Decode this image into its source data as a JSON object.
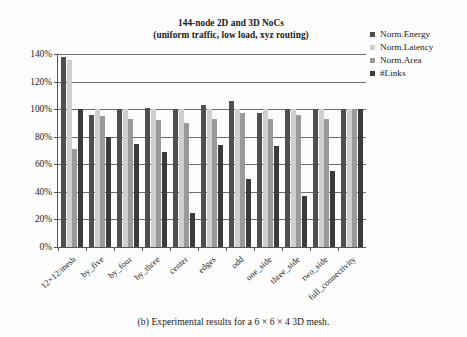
{
  "figure": {
    "caption": "(b) Experimental results for a 6 × 6 × 4 3D mesh."
  },
  "chart_data": {
    "type": "bar",
    "title": "144-node 2D and 3D NoCs\n(uniform traffic, low load, xyz routing)",
    "title_line1": "144-node 2D and 3D NoCs",
    "title_line2": "(uniform traffic, low load, xyz routing)",
    "xlabel": "",
    "ylabel": "",
    "ylim": [
      0,
      140
    ],
    "yticks": [
      0,
      20,
      40,
      60,
      80,
      100,
      120,
      140
    ],
    "ytick_labels": [
      "0%",
      "20%",
      "40%",
      "60%",
      "80%",
      "100%",
      "120%",
      "140%"
    ],
    "grid": true,
    "legend_position": "top-right",
    "categories": [
      "12×12/mesh",
      "by_five",
      "by_four",
      "by_three",
      "center",
      "edges",
      "odd",
      "one_side",
      "three_side",
      "two_side",
      "full_connectivity"
    ],
    "series": [
      {
        "name": "Norm.Energy",
        "color": "#4f4f4f",
        "values": [
          138,
          96,
          100,
          101,
          100,
          103,
          106,
          97,
          100,
          100,
          100
        ]
      },
      {
        "name": "Norm.Latency",
        "color": "#cfcfcf",
        "values": [
          136,
          100,
          100,
          100,
          100,
          100,
          100,
          100,
          100,
          100,
          100
        ]
      },
      {
        "name": "Norm.Area",
        "color": "#9a9a9a",
        "values": [
          71,
          95,
          93,
          92,
          90,
          93,
          97,
          93,
          96,
          93,
          100
        ]
      },
      {
        "name": "#Links",
        "color": "#3b3b3b",
        "values": [
          100,
          80,
          75,
          69,
          25,
          74,
          49,
          73,
          37,
          55,
          100
        ]
      }
    ]
  }
}
